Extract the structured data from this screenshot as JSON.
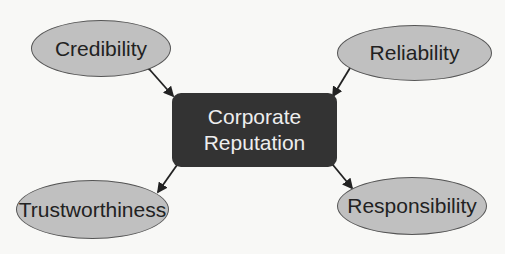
{
  "center": {
    "line1": "Corporate",
    "line2": "Reputation"
  },
  "nodes": [
    {
      "label": "Credibility"
    },
    {
      "label": "Reliability"
    },
    {
      "label": "Trustworthiness"
    },
    {
      "label": "Responsibility"
    }
  ],
  "colors": {
    "ellipse_fill": "#c0c0c0",
    "center_fill": "#333333",
    "background": "#f8f8f6"
  }
}
